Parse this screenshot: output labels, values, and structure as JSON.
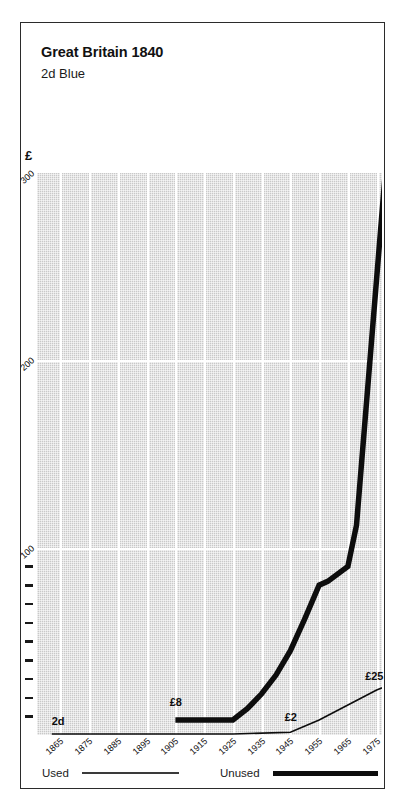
{
  "title": "Great Britain 1840",
  "subtitle": "2d Blue",
  "legend": {
    "used_label": "Used",
    "unused_label": "Unused"
  },
  "chart_data": {
    "type": "line",
    "title": "Great Britain 1840",
    "subtitle": "2d Blue",
    "xlabel": "",
    "ylabel": "£",
    "unit_symbol": "£",
    "xlim": [
      1860,
      1980
    ],
    "ylim": [
      0,
      300
    ],
    "grid": true,
    "legend_position": "bottom",
    "x_tick_labels": [
      "1865",
      "1875",
      "1885",
      "1895",
      "1905",
      "1915",
      "1925",
      "1935",
      "1945",
      "1955",
      "1965",
      "1975"
    ],
    "y_tick_labels": [
      "300",
      "200",
      "100"
    ],
    "y_minor_ticks": [
      90,
      80,
      70,
      60,
      50,
      40,
      30,
      20,
      10
    ],
    "series": [
      {
        "name": "Used",
        "style": "thin",
        "x": [
          1862,
          1905,
          1925,
          1945,
          1955,
          1965,
          1975,
          1980
        ],
        "values": [
          0.5,
          0.5,
          0.5,
          1.5,
          8,
          16,
          24,
          27
        ]
      },
      {
        "name": "Unused",
        "style": "thick",
        "x": [
          1905,
          1925,
          1930,
          1935,
          1940,
          1945,
          1950,
          1955,
          1958,
          1965,
          1968,
          1978
        ],
        "values": [
          8,
          8,
          14,
          22,
          32,
          45,
          62,
          80,
          82,
          90,
          112,
          300
        ]
      }
    ],
    "annotations": [
      {
        "label": "2d",
        "x": 1862,
        "y": 4,
        "note": "start value Used"
      },
      {
        "label": "£8",
        "x": 1903,
        "y": 14,
        "note": "start value Unused"
      },
      {
        "label": "£2",
        "x": 1943,
        "y": 6,
        "note": "Used value 1945"
      },
      {
        "label": "£25",
        "x": 1971,
        "y": 28,
        "note": "Used value 1975"
      }
    ]
  }
}
